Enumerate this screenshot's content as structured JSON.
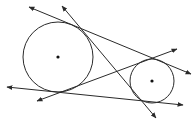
{
  "diagram": {
    "stroke_color": "#2a2a2a",
    "circles": [
      {
        "name": "large-circle",
        "cx": 58,
        "cy": 57,
        "r": 35
      },
      {
        "name": "small-circle",
        "cx": 152,
        "cy": 81,
        "r": 22
      }
    ],
    "lines": [
      {
        "name": "external-tangent-top",
        "x1": 29,
        "y1": 7,
        "x2": 191,
        "y2": 74
      },
      {
        "name": "internal-tangent-steep",
        "x1": 62,
        "y1": 6,
        "x2": 156,
        "y2": 118
      },
      {
        "name": "internal-tangent-shallow",
        "x1": 37,
        "y1": 101,
        "x2": 177,
        "y2": 49
      },
      {
        "name": "external-tangent-bottom",
        "x1": 7,
        "y1": 87,
        "x2": 183,
        "y2": 105
      }
    ]
  }
}
